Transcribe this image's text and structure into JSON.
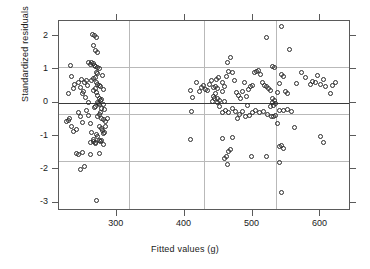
{
  "chart_data": {
    "type": "scatter",
    "title": "",
    "xlabel": "Fitted values (g)",
    "ylabel": "Standardized residuals",
    "xlim": [
      215,
      645
    ],
    "ylim": [
      -3.25,
      2.45
    ],
    "xticks": [
      300,
      400,
      500,
      600
    ],
    "xticklabels": [
      "300",
      "400",
      "500",
      "600"
    ],
    "yticks": [
      2,
      1,
      0,
      -1,
      -2,
      -3
    ],
    "yticklabels": [
      "2",
      "1",
      "0",
      "-1",
      "-2",
      "-3"
    ],
    "grid": true,
    "grid_color": "#b9b9b9",
    "h_gridlines": [
      1.07,
      -0.34,
      -1.75
    ],
    "v_gridlines": [
      318,
      428,
      535
    ],
    "reference_line": {
      "y": 0,
      "color": "#3a3a3a"
    },
    "marker": "open-circle",
    "marker_color": "#2b2b2b",
    "legend": null,
    "points": [
      [
        232,
        1.12
      ],
      [
        229,
        0.27
      ],
      [
        226,
        -0.55
      ],
      [
        229,
        -0.52
      ],
      [
        231,
        -0.47
      ],
      [
        234,
        0.8
      ],
      [
        236,
        0.43
      ],
      [
        238,
        0.56
      ],
      [
        233,
        -0.7
      ],
      [
        237,
        -0.86
      ],
      [
        240,
        -0.8
      ],
      [
        241,
        -1.52
      ],
      [
        244,
        -1.55
      ],
      [
        247,
        -2.0
      ],
      [
        252,
        -1.9
      ],
      [
        249,
        -1.48
      ],
      [
        253,
        0.62
      ],
      [
        251,
        0.34
      ],
      [
        255,
        0.68
      ],
      [
        257,
        0.53
      ],
      [
        254,
        0.15
      ],
      [
        258,
        0.02
      ],
      [
        256,
        -0.22
      ],
      [
        259,
        -0.38
      ],
      [
        261,
        -0.62
      ],
      [
        263,
        -0.88
      ],
      [
        265,
        -1.1
      ],
      [
        262,
        -1.18
      ],
      [
        266,
        -1.15
      ],
      [
        268,
        -1.2
      ],
      [
        264,
        2.05
      ],
      [
        267,
        2.02
      ],
      [
        270,
        1.96
      ],
      [
        266,
        1.72
      ],
      [
        268,
        1.58
      ],
      [
        271,
        1.52
      ],
      [
        263,
        1.22
      ],
      [
        265,
        1.18
      ],
      [
        267,
        1.12
      ],
      [
        269,
        1.08
      ],
      [
        272,
        1.05
      ],
      [
        274,
        1.02
      ],
      [
        259,
        1.2
      ],
      [
        261,
        1.15
      ],
      [
        270,
        0.92
      ],
      [
        272,
        0.88
      ],
      [
        268,
        0.76
      ],
      [
        266,
        0.72
      ],
      [
        263,
        0.66
      ],
      [
        270,
        0.6
      ],
      [
        272,
        0.56
      ],
      [
        274,
        0.52
      ],
      [
        276,
        0.48
      ],
      [
        268,
        0.44
      ],
      [
        266,
        0.38
      ],
      [
        270,
        0.3
      ],
      [
        272,
        0.22
      ],
      [
        274,
        0.14
      ],
      [
        276,
        0.06
      ],
      [
        271,
        0.02
      ],
      [
        273,
        -0.02
      ],
      [
        275,
        -0.06
      ],
      [
        269,
        -0.1
      ],
      [
        267,
        -0.14
      ],
      [
        277,
        -0.18
      ],
      [
        279,
        0.82
      ],
      [
        281,
        0.4
      ],
      [
        278,
        0.1
      ],
      [
        280,
        -0.05
      ],
      [
        282,
        -0.2
      ],
      [
        276,
        -0.3
      ],
      [
        274,
        -0.36
      ],
      [
        272,
        -0.42
      ],
      [
        278,
        -0.46
      ],
      [
        280,
        -0.5
      ],
      [
        283,
        -0.55
      ],
      [
        275,
        -0.72
      ],
      [
        277,
        -0.78
      ],
      [
        279,
        -0.82
      ],
      [
        281,
        -0.92
      ],
      [
        270,
        -0.95
      ],
      [
        272,
        -1.0
      ],
      [
        274,
        -1.12
      ],
      [
        276,
        -1.16
      ],
      [
        278,
        -1.14
      ],
      [
        268,
        -1.22
      ],
      [
        280,
        -1.25
      ],
      [
        282,
        -0.9
      ],
      [
        284,
        -0.72
      ],
      [
        286,
        -0.48
      ],
      [
        262,
        -1.55
      ],
      [
        275,
        -1.52
      ],
      [
        270,
        -2.93
      ],
      [
        250,
        0.28
      ],
      [
        246,
        0.46
      ],
      [
        243,
        0.6
      ],
      [
        248,
        0.7
      ],
      [
        244,
        -0.3
      ],
      [
        246,
        -0.42
      ],
      [
        249,
        -0.58
      ],
      [
        408,
        0.38
      ],
      [
        412,
        0.17
      ],
      [
        410,
        -0.26
      ],
      [
        409,
        -1.1
      ],
      [
        418,
        0.6
      ],
      [
        422,
        0.33
      ],
      [
        425,
        0.46
      ],
      [
        428,
        0.52
      ],
      [
        431,
        0.41
      ],
      [
        434,
        0.36
      ],
      [
        437,
        0.56
      ],
      [
        440,
        0.66
      ],
      [
        443,
        0.45
      ],
      [
        446,
        0.5
      ],
      [
        449,
        0.42
      ],
      [
        445,
        0.28
      ],
      [
        442,
        0.2
      ],
      [
        448,
        0.13
      ],
      [
        452,
        0.08
      ],
      [
        455,
        0.35
      ],
      [
        458,
        0.48
      ],
      [
        461,
        0.8
      ],
      [
        464,
        0.95
      ],
      [
        467,
        1.36
      ],
      [
        463,
        1.2
      ],
      [
        470,
        0.92
      ],
      [
        473,
        0.68
      ],
      [
        476,
        0.3
      ],
      [
        479,
        0.22
      ],
      [
        482,
        0.12
      ],
      [
        485,
        0.35
      ],
      [
        488,
        0.6
      ],
      [
        491,
        0.18
      ],
      [
        494,
        0.4
      ],
      [
        497,
        0.5
      ],
      [
        500,
        0.52
      ],
      [
        503,
        0.9
      ],
      [
        506,
        0.93
      ],
      [
        509,
        0.98
      ],
      [
        512,
        0.85
      ],
      [
        515,
        0.62
      ],
      [
        518,
        0.52
      ],
      [
        521,
        0.48
      ],
      [
        524,
        0.44
      ],
      [
        527,
        0.38
      ],
      [
        530,
        1.1
      ],
      [
        533,
        1.06
      ],
      [
        530,
        0.12
      ],
      [
        532,
        0.06
      ],
      [
        529,
        0.02
      ],
      [
        534,
        -0.02
      ],
      [
        531,
        -0.08
      ],
      [
        527,
        -0.12
      ],
      [
        536,
        0.32
      ],
      [
        539,
        0.58
      ],
      [
        542,
        0.86
      ],
      [
        545,
        0.8
      ],
      [
        548,
        0.35
      ],
      [
        552,
        0.28
      ],
      [
        555,
        1.6
      ],
      [
        543,
        2.28
      ],
      [
        520,
        1.95
      ],
      [
        565,
        0.58
      ],
      [
        572,
        0.92
      ],
      [
        578,
        0.75
      ],
      [
        585,
        0.56
      ],
      [
        592,
        0.6
      ],
      [
        600,
        0.54
      ],
      [
        608,
        0.48
      ],
      [
        615,
        0.28
      ],
      [
        622,
        0.6
      ],
      [
        618,
        0.52
      ],
      [
        604,
        0.7
      ],
      [
        596,
        0.82
      ],
      [
        588,
        0.63
      ],
      [
        455,
        -0.28
      ],
      [
        460,
        -0.22
      ],
      [
        465,
        -0.3
      ],
      [
        470,
        -0.18
      ],
      [
        475,
        -0.26
      ],
      [
        480,
        -0.34
      ],
      [
        485,
        -0.25
      ],
      [
        490,
        -0.4
      ],
      [
        495,
        -0.38
      ],
      [
        500,
        -0.28
      ],
      [
        505,
        -0.22
      ],
      [
        510,
        -0.3
      ],
      [
        516,
        -0.26
      ],
      [
        522,
        -0.36
      ],
      [
        528,
        -0.4
      ],
      [
        531,
        -0.42
      ],
      [
        534,
        -0.38
      ],
      [
        540,
        -0.22
      ],
      [
        546,
        -0.24
      ],
      [
        552,
        -0.2
      ],
      [
        558,
        -0.26
      ],
      [
        536,
        -0.62
      ],
      [
        542,
        -1.28
      ],
      [
        539,
        -1.3
      ],
      [
        545,
        -1.38
      ],
      [
        562,
        -0.74
      ],
      [
        600,
        -1.02
      ],
      [
        604,
        -1.2
      ],
      [
        455,
        -1.08
      ],
      [
        470,
        -1.04
      ],
      [
        459,
        -1.68
      ],
      [
        462,
        -1.62
      ],
      [
        465,
        -1.46
      ],
      [
        468,
        -1.4
      ],
      [
        463,
        -1.84
      ],
      [
        498,
        -1.6
      ],
      [
        520,
        -1.62
      ],
      [
        540,
        -1.8
      ],
      [
        542,
        -2.68
      ],
      [
        449,
        0.02
      ],
      [
        452,
        -0.12
      ],
      [
        492,
        -0.08
      ],
      [
        455,
        0.62
      ],
      [
        458,
        0.04
      ],
      [
        478,
        -0.46
      ],
      [
        447,
        0.7
      ],
      [
        450,
        0.76
      ],
      [
        444,
        0.12
      ],
      [
        441,
        0.04
      ]
    ]
  }
}
